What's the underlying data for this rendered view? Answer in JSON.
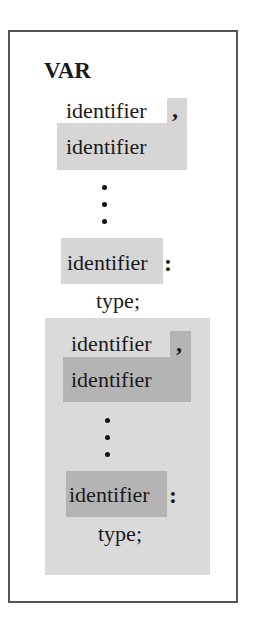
{
  "diagram": {
    "keyword": "VAR",
    "group1": {
      "identifiers": [
        "identifier",
        "identifier",
        "identifier"
      ],
      "separator": ",",
      "colon": ":",
      "type": "type;"
    },
    "group2": {
      "identifiers": [
        "identifier",
        "identifier",
        "identifier"
      ],
      "separator": ",",
      "colon": ":",
      "type": "type;"
    },
    "colors": {
      "shade_light": "#d6d6d6",
      "shade_block": "#dadada",
      "shade_dark": "#b4b4b4",
      "border": "#555555"
    }
  }
}
